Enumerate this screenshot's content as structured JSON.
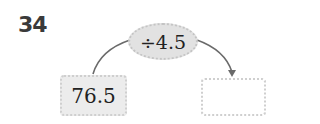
{
  "problem_number": "34",
  "operation": "÷4.5",
  "input_value": "76.5",
  "output_value": "",
  "colors": {
    "oval_fill": "#e2e2e2",
    "box_fill": "#ececec",
    "arrow": "#6a6a6a",
    "text": "#222222"
  }
}
